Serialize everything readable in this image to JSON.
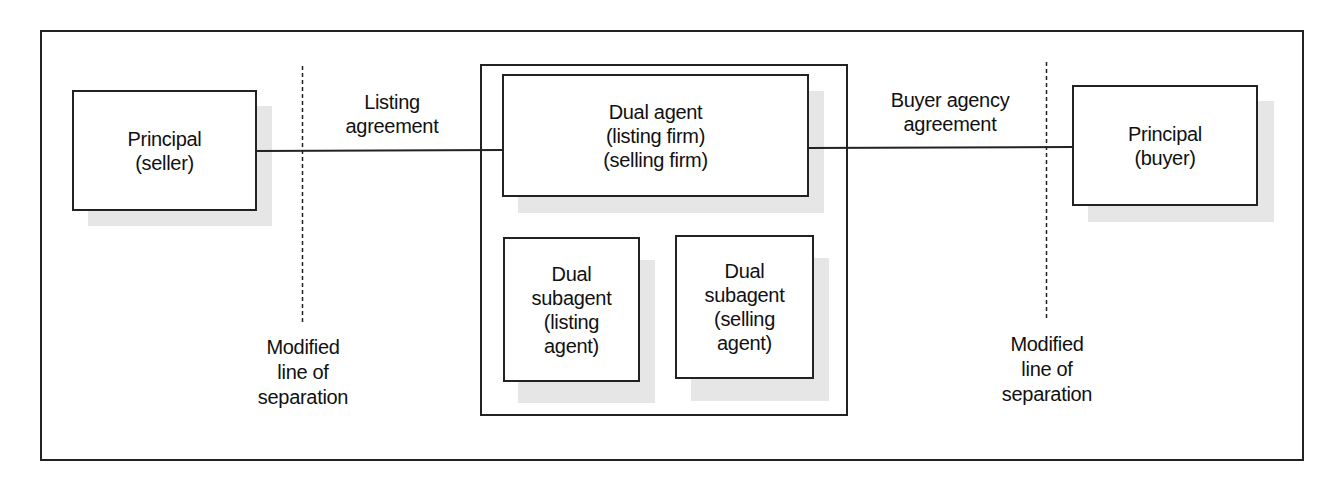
{
  "diagram": {
    "type": "dual agency relationship diagram",
    "colors": {
      "line": "#222222",
      "shadow": "#e6e6e6",
      "background": "#ffffff"
    },
    "left_principal": {
      "lines": [
        "Principal",
        "(seller)"
      ]
    },
    "right_principal": {
      "lines": [
        "Principal",
        "(buyer)"
      ]
    },
    "dual_agent": {
      "lines": [
        "Dual agent",
        "(listing firm)",
        "(selling firm)"
      ]
    },
    "subagent_left": {
      "lines": [
        "Dual",
        "subagent",
        "(listing",
        "agent)"
      ]
    },
    "subagent_right": {
      "lines": [
        "Dual",
        "subagent",
        "(selling",
        "agent)"
      ]
    },
    "left_connector_label": {
      "lines": [
        "Listing",
        "agreement"
      ]
    },
    "right_connector_label": {
      "lines": [
        "Buyer agency",
        "agreement"
      ]
    },
    "left_separation_label": {
      "lines": [
        "Modified",
        "line of",
        "separation"
      ]
    },
    "right_separation_label": {
      "lines": [
        "Modified",
        "line of",
        "separation"
      ]
    }
  }
}
